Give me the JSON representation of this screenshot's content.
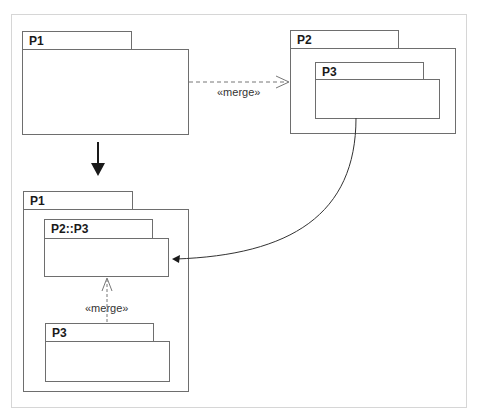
{
  "top_cutoff_text": "Figure 11.1 merge",
  "diagram": {
    "before": {
      "p1": {
        "label": "P1"
      },
      "p2": {
        "label": "P2",
        "nested": {
          "label": "P3"
        }
      },
      "merge_label": "«merge»"
    },
    "transform_arrow": "down-arrow",
    "after": {
      "p1": {
        "label": "P1"
      },
      "merged_package": {
        "label": "P2::P3"
      },
      "p3": {
        "label": "P3"
      },
      "merge_label": "«merge»"
    }
  },
  "colors": {
    "line": "#6e6e6e",
    "frame": "#d6d6d6",
    "text": "#1a1a1a",
    "arrow": "#1a1a1a"
  }
}
